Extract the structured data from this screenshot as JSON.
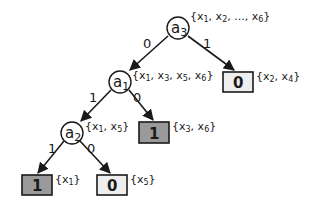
{
  "diagram": {
    "type": "decision-tree",
    "colors": {
      "edge": "#1a1a1a",
      "leaf_positive_fill": "#9a9a9a",
      "leaf_negative_fill": "#eeeeee",
      "node_fill": "#ffffff"
    },
    "nodes": [
      {
        "id": "a3",
        "label": "a",
        "sub": "3",
        "set": "{x1, x2, ..., x6}",
        "set_display": [
          "{x",
          "1",
          ", x",
          "2",
          ", ..., x",
          "6",
          "}"
        ]
      },
      {
        "id": "a1",
        "label": "a",
        "sub": "1",
        "set": "{x1, x3, x5, x6}",
        "set_display": [
          "{x",
          "1",
          ", x",
          "3",
          ", x",
          "5",
          ", x",
          "6",
          "}"
        ]
      },
      {
        "id": "a2",
        "label": "a",
        "sub": "2",
        "set": "{x1, x5}",
        "set_display": [
          "{x",
          "1",
          ", x",
          "5",
          "}"
        ]
      }
    ],
    "leaves": [
      {
        "id": "leaf-a3-1",
        "value": "0",
        "set": "{x2, x4}",
        "set_display": [
          "{x",
          "2",
          ", x",
          "4",
          "}"
        ],
        "shaded": false
      },
      {
        "id": "leaf-a1-0",
        "value": "1",
        "set": "{x3, x6}",
        "set_display": [
          "{x",
          "3",
          ", x",
          "6",
          "}"
        ],
        "shaded": true
      },
      {
        "id": "leaf-a2-1",
        "value": "1",
        "set": "{x1}",
        "set_display": [
          "{x",
          "1",
          "}"
        ],
        "shaded": true
      },
      {
        "id": "leaf-a2-0",
        "value": "0",
        "set": "{x5}",
        "set_display": [
          "{x",
          "5",
          "}"
        ],
        "shaded": false
      }
    ],
    "edges": [
      {
        "from": "a3",
        "to": "a1",
        "label": "0"
      },
      {
        "from": "a3",
        "to": "leaf-a3-1",
        "label": "1"
      },
      {
        "from": "a1",
        "to": "a2",
        "label": "1"
      },
      {
        "from": "a1",
        "to": "leaf-a1-0",
        "label": "0"
      },
      {
        "from": "a2",
        "to": "leaf-a2-1",
        "label": "1"
      },
      {
        "from": "a2",
        "to": "leaf-a2-0",
        "label": "0"
      }
    ]
  }
}
